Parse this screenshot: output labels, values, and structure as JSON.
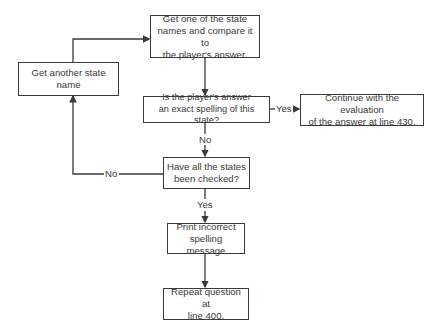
{
  "diagram": {
    "type": "flowchart",
    "nodes": {
      "get_state": {
        "text": "Get one of the state\nnames and compare it to\nthe player's answer."
      },
      "get_another": {
        "text": "Get another state name"
      },
      "exact_check": {
        "text": "Is the player's answer\nan exact spelling of this state?"
      },
      "continue_eval": {
        "text": "Continue with the evaluation\nof the answer at line 430."
      },
      "all_checked": {
        "text": "Have all the states\nbeen checked?"
      },
      "print_msg": {
        "text": "Print incorrect\nspelling message"
      },
      "repeat_q": {
        "text": "Repeat question at\nline 400."
      }
    },
    "edge_labels": {
      "exact_no": "No",
      "exact_yes": "Yes",
      "checked_no": "No",
      "checked_yes": "Yes"
    },
    "edges": [
      {
        "from": "get_another",
        "to": "get_state",
        "label": ""
      },
      {
        "from": "get_state",
        "to": "exact_check",
        "label": ""
      },
      {
        "from": "exact_check",
        "to": "continue_eval",
        "label": "Yes"
      },
      {
        "from": "exact_check",
        "to": "all_checked",
        "label": "No"
      },
      {
        "from": "all_checked",
        "to": "get_another",
        "label": "No"
      },
      {
        "from": "all_checked",
        "to": "print_msg",
        "label": "Yes"
      },
      {
        "from": "print_msg",
        "to": "repeat_q",
        "label": ""
      }
    ],
    "colors": {
      "line": "#3a3a3a",
      "background": "#ffffff"
    }
  }
}
